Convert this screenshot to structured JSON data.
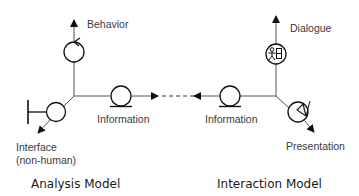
{
  "diagram": {
    "analysis_model": {
      "title": "Analysis Model",
      "nodes": {
        "behavior": {
          "label": "Behavior",
          "icon": "control-object-icon"
        },
        "information": {
          "label": "Information",
          "icon": "entity-object-icon"
        },
        "interface": {
          "label_line1": "Interface",
          "label_line2": "(non-human)",
          "icon": "boundary-object-icon"
        }
      }
    },
    "interaction_model": {
      "title": "Interaction Model",
      "nodes": {
        "dialogue": {
          "label": "Dialogue",
          "icon": "dialogue-object-icon",
          "glyph": "夷日"
        },
        "information": {
          "label": "Information",
          "icon": "entity-object-icon"
        },
        "presentation": {
          "label": "Presentation",
          "icon": "presentation-object-icon"
        }
      }
    },
    "connector": {
      "style": "dashed",
      "direction": "bidirectional"
    }
  }
}
